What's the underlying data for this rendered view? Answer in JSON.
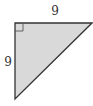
{
  "diagram": {
    "type": "right-triangle",
    "labels": {
      "top_side": "9",
      "left_side": "9"
    },
    "right_angle_marker": true,
    "colors": {
      "fill": "#d9d9d9",
      "stroke": "#333333"
    }
  }
}
